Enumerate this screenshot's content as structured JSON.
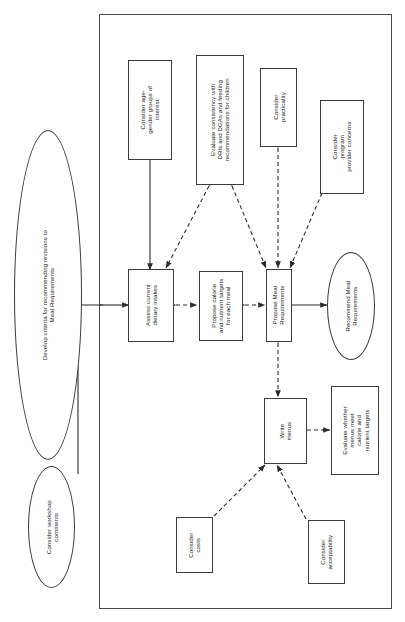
{
  "diagram": {
    "orientation": "rotated-90-ccw",
    "stroke_color": "#3a3a3a",
    "text_color": "#1d1d1d",
    "background": "#ffffff",
    "nodes": [
      {
        "id": "develop-criteria",
        "shape": "ellipse",
        "label": "Develop criteria for recommending revisions to\nMeal Requirements"
      },
      {
        "id": "consider-workshop-comments",
        "shape": "ellipse",
        "label": "Consider workshop\ncomments"
      },
      {
        "id": "consider-age-gender-groups",
        "shape": "box",
        "label": "Consider age-\ngender groups of\ninterest"
      },
      {
        "id": "evaluate-consistency",
        "shape": "box",
        "label": "Evaluate consistency with\nDRIs and DGAs and feeding\nrecommendations for children"
      },
      {
        "id": "consider-practicality",
        "shape": "box",
        "label": "Consider\npracticality"
      },
      {
        "id": "consider-program-provider-concerns",
        "shape": "box",
        "label": "Consider\nprogram\nprovider concerns"
      },
      {
        "id": "assess-current-dietary-intakes",
        "shape": "box",
        "label": "Assess current\ndietary intakes"
      },
      {
        "id": "propose-calorie-nutrient-targets",
        "shape": "box",
        "label": "Propose calorie\nand nutrient targets\nfor each meal"
      },
      {
        "id": "propose-meal-requirements",
        "shape": "box",
        "label": "Propose Meal\nRequirements"
      },
      {
        "id": "recommend-meal-requirements",
        "shape": "ellipse",
        "label": "Recommend Meal\nRequirements"
      },
      {
        "id": "write-menus",
        "shape": "box",
        "label": "Write\nmenus"
      },
      {
        "id": "evaluate-menus-meet-targets",
        "shape": "box",
        "label": "Evaluate whether\nmenus meet\ncalorie and\nnutrient targets"
      },
      {
        "id": "consider-costs",
        "shape": "box",
        "label": "Consider\ncosts"
      },
      {
        "id": "consider-acceptability",
        "shape": "box",
        "label": "Consider\nacceptability"
      }
    ],
    "edges": [
      {
        "from": "consider-workshop-comments",
        "to": "develop-criteria",
        "style": "solid",
        "arrow": "single"
      },
      {
        "from": "develop-criteria",
        "to": "assess-current-dietary-intakes",
        "style": "solid",
        "arrow": "single"
      },
      {
        "from": "consider-age-gender-groups",
        "to": "assess-current-dietary-intakes",
        "style": "solid",
        "arrow": "single"
      },
      {
        "from": "evaluate-consistency",
        "to": "assess-current-dietary-intakes",
        "style": "dashed",
        "arrow": "double"
      },
      {
        "from": "evaluate-consistency",
        "to": "propose-meal-requirements",
        "style": "dashed",
        "arrow": "double"
      },
      {
        "from": "assess-current-dietary-intakes",
        "to": "propose-calorie-nutrient-targets",
        "style": "dashed",
        "arrow": "double"
      },
      {
        "from": "propose-calorie-nutrient-targets",
        "to": "propose-meal-requirements",
        "style": "dashed",
        "arrow": "double"
      },
      {
        "from": "consider-practicality",
        "to": "propose-meal-requirements",
        "style": "dashed",
        "arrow": "double"
      },
      {
        "from": "consider-program-provider-concerns",
        "to": "propose-meal-requirements",
        "style": "dashed",
        "arrow": "double"
      },
      {
        "from": "propose-meal-requirements",
        "to": "recommend-meal-requirements",
        "style": "solid",
        "arrow": "single"
      },
      {
        "from": "propose-meal-requirements",
        "to": "write-menus",
        "style": "dashed",
        "arrow": "double"
      },
      {
        "from": "write-menus",
        "to": "evaluate-menus-meet-targets",
        "style": "dashed",
        "arrow": "double"
      },
      {
        "from": "consider-costs",
        "to": "write-menus",
        "style": "dashed",
        "arrow": "single"
      },
      {
        "from": "consider-acceptability",
        "to": "write-menus",
        "style": "dashed",
        "arrow": "single"
      }
    ]
  }
}
